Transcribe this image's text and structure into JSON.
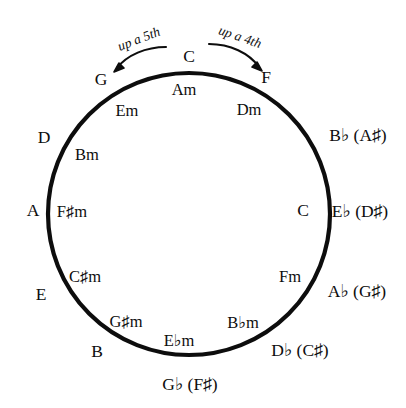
{
  "diagram": {
    "background_color": "#ffffff",
    "stroke_color": "#0d0d0d",
    "circle": {
      "cx": 189,
      "cy": 214,
      "r": 141,
      "stroke_width": 4.2
    },
    "annotations": {
      "left_arrow_label": "up a 5th",
      "right_arrow_label": "up a 4th"
    },
    "major_keys": [
      {
        "name": "C",
        "angle_deg": 0,
        "x": 189,
        "y": 57,
        "enharmonic": ""
      },
      {
        "name": "F",
        "angle_deg": 30,
        "x": 266,
        "y": 78,
        "enharmonic": ""
      },
      {
        "name": "B♭ (A♯)",
        "angle_deg": 60,
        "x": 358,
        "y": 136,
        "enharmonic": "A♯"
      },
      {
        "name": "E♭ (D♯)",
        "angle_deg": 90,
        "x": 360,
        "y": 212,
        "enharmonic": "D♯"
      },
      {
        "name": "A♭ (G♯)",
        "angle_deg": 120,
        "x": 357,
        "y": 292,
        "enharmonic": "G♯"
      },
      {
        "name": "D♭ (C♯)",
        "angle_deg": 150,
        "x": 300,
        "y": 351,
        "enharmonic": "C♯"
      },
      {
        "name": "G♭ (F♯)",
        "angle_deg": 180,
        "x": 190,
        "y": 385,
        "enharmonic": "F♯"
      },
      {
        "name": "B",
        "angle_deg": 210,
        "x": 97,
        "y": 352,
        "enharmonic": ""
      },
      {
        "name": "E",
        "angle_deg": 240,
        "x": 41,
        "y": 295,
        "enharmonic": ""
      },
      {
        "name": "A",
        "angle_deg": 270,
        "x": 33,
        "y": 211,
        "enharmonic": ""
      },
      {
        "name": "D",
        "angle_deg": 300,
        "x": 44,
        "y": 138,
        "enharmonic": ""
      },
      {
        "name": "G",
        "angle_deg": 330,
        "x": 101,
        "y": 80,
        "enharmonic": ""
      }
    ],
    "relative_minors": [
      {
        "name": "Am",
        "x": 184,
        "y": 90
      },
      {
        "name": "Dm",
        "x": 249,
        "y": 110
      },
      {
        "name": "Gm",
        "x": 0,
        "y": 0
      },
      {
        "name": "Cm",
        "x": 0,
        "y": 0
      },
      {
        "name": "Fm",
        "x": 290,
        "y": 277
      },
      {
        "name": "B♭m",
        "x": 243,
        "y": 323
      },
      {
        "name": "E♭m",
        "x": 179,
        "y": 341
      },
      {
        "name": "G♯m",
        "x": 126,
        "y": 322
      },
      {
        "name": "C♯m",
        "x": 85,
        "y": 277
      },
      {
        "name": "F♯m",
        "x": 72,
        "y": 212
      },
      {
        "name": "Bm",
        "x": 87,
        "y": 155
      },
      {
        "name": "Em",
        "x": 127,
        "y": 111
      }
    ],
    "inner_labels_visible": [
      "Am",
      "Dm",
      "Fm",
      "B♭m",
      "E♭m",
      "G♯m",
      "C♯m",
      "F♯m",
      "Bm",
      "Em"
    ],
    "right_inner_major": {
      "name": "C",
      "x": 303,
      "y": 211
    }
  }
}
